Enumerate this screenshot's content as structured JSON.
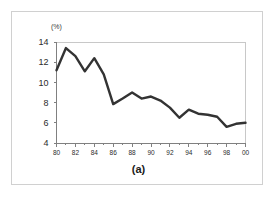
{
  "figure": {
    "caption": "(a)",
    "unit_label": "(%)",
    "line_color": "#333333",
    "axis_color": "#808080",
    "border_color": "#d0d0d0",
    "background": "#ffffff"
  },
  "chart_data": {
    "type": "line",
    "title": "",
    "subtitle": "",
    "xlabel": "",
    "ylabel": "(%)",
    "x": [
      80,
      81,
      82,
      83,
      84,
      85,
      86,
      87,
      88,
      89,
      90,
      91,
      92,
      93,
      94,
      95,
      96,
      97,
      98,
      99,
      0
    ],
    "x_tick_labels": [
      "80",
      "82",
      "84",
      "86",
      "88",
      "90",
      "92",
      "94",
      "96",
      "98",
      "00"
    ],
    "x_tick_values": [
      80,
      82,
      84,
      86,
      88,
      90,
      92,
      94,
      96,
      98,
      100
    ],
    "y_tick_labels": [
      "14",
      "12",
      "10",
      "8",
      "6",
      "4"
    ],
    "y_tick_values": [
      14,
      12,
      10,
      8,
      6,
      4
    ],
    "values": [
      11.2,
      13.4,
      12.6,
      11.1,
      12.4,
      10.8,
      7.85,
      8.4,
      9.0,
      8.4,
      8.6,
      8.2,
      7.5,
      6.5,
      7.3,
      6.9,
      6.8,
      6.6,
      5.6,
      5.9,
      6.0
    ],
    "series": [
      {
        "name": "(a)",
        "values": [
          11.2,
          13.4,
          12.6,
          11.1,
          12.4,
          10.8,
          7.85,
          8.4,
          9.0,
          8.4,
          8.6,
          8.2,
          7.5,
          6.5,
          7.3,
          6.9,
          6.8,
          6.6,
          5.6,
          5.9,
          6.0
        ]
      }
    ],
    "xlim": [
      80,
      100
    ],
    "ylim": [
      4,
      14
    ],
    "grid": false,
    "legend": false,
    "markers": false,
    "annotations": []
  }
}
